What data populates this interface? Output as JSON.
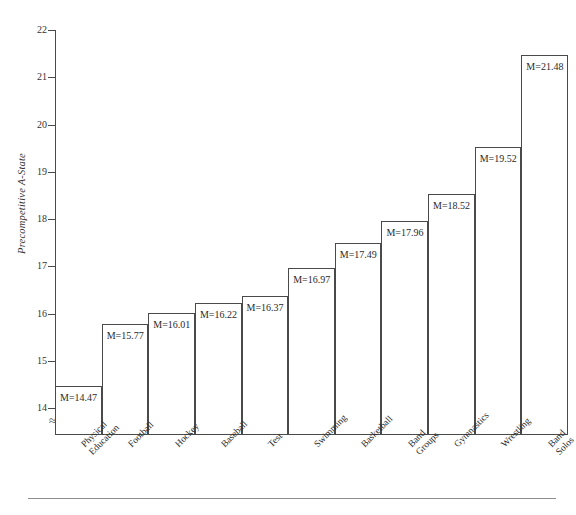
{
  "chart_data": {
    "type": "bar",
    "title": "",
    "subtitle": "",
    "xlabel": "",
    "ylabel": "Precompetitive A-State",
    "ylim": [
      14,
      22
    ],
    "y_axis_broken_below": 14,
    "y_ticks": [
      22,
      21,
      20,
      19,
      18,
      17,
      16,
      15,
      14
    ],
    "grid": false,
    "legend": "none",
    "value_label_prefix": "M=",
    "categories": [
      "Physical Education",
      "Football",
      "Hockey",
      "Baseball",
      "Test",
      "Swimming",
      "Basketball",
      "Band Groups",
      "Gymnastics",
      "Wrestling",
      "Band Solos"
    ],
    "category_lines": [
      [
        "Physical",
        "Education"
      ],
      [
        "Football"
      ],
      [
        "Hockey"
      ],
      [
        "Baseball"
      ],
      [
        "Test"
      ],
      [
        "Swimming"
      ],
      [
        "Basketball"
      ],
      [
        "Band",
        "Groups"
      ],
      [
        "Gymnastics"
      ],
      [
        "Wrestling"
      ],
      [
        "Band",
        "Solos"
      ]
    ],
    "values": [
      14.47,
      15.77,
      16.01,
      16.22,
      16.37,
      16.97,
      17.49,
      17.96,
      18.52,
      19.52,
      21.48
    ],
    "value_labels": [
      "M=14.47",
      "M=15.77",
      "M=16.01",
      "M=16.22",
      "M=16.37",
      "M=16.97",
      "M=17.49",
      "M=17.96",
      "M=18.52",
      "M=19.52",
      "M=21.48"
    ],
    "colors": {
      "bar_fill": "#ffffff",
      "bar_stroke": "#4a4a4a",
      "axis": "#4a4a4a",
      "text": "#2a2a2a",
      "background": "#ffffff",
      "footer_rule": "#8d8d8d"
    }
  },
  "axis_break_glyph": "≈"
}
